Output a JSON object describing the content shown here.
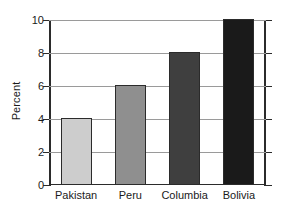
{
  "chart_data": {
    "type": "bar",
    "title": "",
    "xlabel": "",
    "ylabel": "Percent",
    "categories": [
      "Pakistan",
      "Peru",
      "Columbia",
      "Bolivia"
    ],
    "values": [
      4,
      6,
      8,
      10
    ],
    "ylim": [
      0,
      10
    ],
    "ytick_values": [
      0,
      2,
      4,
      6,
      8,
      10
    ],
    "ytick_labels": [
      "0",
      "2",
      "4",
      "6",
      "8",
      "10"
    ],
    "grid": "horizontal",
    "legend": "none",
    "bar_colors": [
      "#cdcdcd",
      "#8f8f8f",
      "#3f3f3f",
      "#1a1a1a"
    ],
    "bar_edge_color": "#2b2b2b",
    "axis_color": "#2b2b2b",
    "gridline_color": "#9a9a9a",
    "background_color": "#ffffff"
  }
}
